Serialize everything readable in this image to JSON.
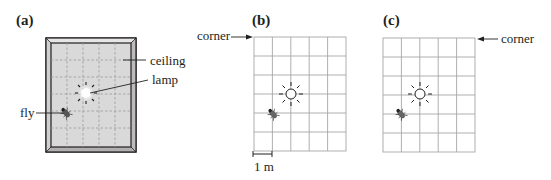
{
  "figure": {
    "panels": [
      {
        "id": "a",
        "label": "(a)",
        "description": "Ceiling with lamp and fly (perspective view)",
        "annotations": {
          "ceiling": "ceiling",
          "lamp": "lamp",
          "fly": "fly"
        }
      },
      {
        "id": "b",
        "label": "(b)",
        "description": "Grid view of ceiling, origin at top-left corner",
        "annotations": {
          "corner": "corner",
          "scale": "1 m"
        },
        "grid": {
          "columns": 5,
          "rows": 6
        }
      },
      {
        "id": "c",
        "label": "(c)",
        "description": "Grid view of ceiling, origin at top-right corner",
        "annotations": {
          "corner": "corner"
        },
        "grid": {
          "columns": 5,
          "rows": 6
        }
      }
    ]
  },
  "colors": {
    "ink": "#231f20",
    "ceiling_fill": "#d9d9d9",
    "frame_fill": "#bfbfbf",
    "grid_line": "#a6a6a6",
    "dashed_grid": "#9a9a9a",
    "lamp_glow": "#ffffff"
  }
}
